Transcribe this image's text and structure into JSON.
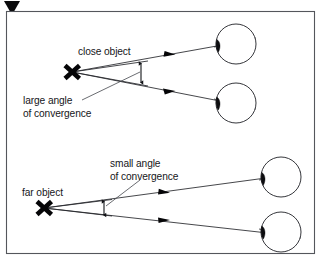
{
  "figure": {
    "corner_marker": "down-triangle-marker",
    "frame": {
      "x": 6,
      "y": 11,
      "width": 309,
      "height": 243,
      "stroke": "#54565c",
      "fill": "#ffffff"
    }
  },
  "labels": {
    "close_object": "close object",
    "large_angle_line1": "large angle",
    "large_angle_line2": "of convergence",
    "far_object": "far object",
    "small_angle_line1": "small angle",
    "small_angle_line2": "of convergence"
  },
  "colors": {
    "ink": "#16161a",
    "ray": "#25262b",
    "frame": "#54565c",
    "lens_fill": "#0d0d10",
    "marker": "#050507",
    "background": "#ffffff"
  },
  "diagram": {
    "panels": [
      {
        "name": "close-object-panel",
        "object_label": "close object",
        "angle_label": "large angle of convergence",
        "angle_size": "large",
        "object_point": {
          "x": 72,
          "y": 72
        },
        "eyes": [
          {
            "name": "upper-eye",
            "cx": 236,
            "cy": 44,
            "r": 20
          },
          {
            "name": "lower-eye",
            "cx": 236,
            "cy": 103,
            "r": 20
          }
        ],
        "rays": [
          {
            "name": "ray-to-upper-eye",
            "from": {
              "x": 72,
              "y": 72
            },
            "to": {
              "x": 252,
              "y": 40
            },
            "arrow_at": {
              "x": 170,
              "y": 55
            }
          },
          {
            "name": "ray-to-lower-eye",
            "from": {
              "x": 72,
              "y": 72
            },
            "to": {
              "x": 252,
              "y": 107
            },
            "arrow_at": {
              "x": 170,
              "y": 91
            }
          }
        ],
        "angle_arrow": {
          "x": 141,
          "y_top": 62,
          "y_bottom": 84
        }
      },
      {
        "name": "far-object-panel",
        "object_label": "far object",
        "angle_label": "small angle of convergence",
        "angle_size": "small",
        "object_point": {
          "x": 44,
          "y": 208
        },
        "eyes": [
          {
            "name": "upper-eye",
            "cx": 281,
            "cy": 177,
            "r": 20
          },
          {
            "name": "lower-eye",
            "cx": 281,
            "cy": 232,
            "r": 20
          }
        ],
        "rays": [
          {
            "name": "ray-to-upper-eye",
            "from": {
              "x": 44,
              "y": 208
            },
            "to": {
              "x": 297,
              "y": 174
            },
            "arrow_at": {
              "x": 165,
              "y": 192
            }
          },
          {
            "name": "ray-to-lower-eye",
            "from": {
              "x": 44,
              "y": 208
            },
            "to": {
              "x": 297,
              "y": 236
            },
            "arrow_at": {
              "x": 165,
              "y": 221
            }
          }
        ],
        "angle_arrow": {
          "x": 104,
          "y_top": 200,
          "y_bottom": 216
        }
      }
    ]
  },
  "icons": {
    "corner": "down-triangle-icon",
    "object_marker": "x-cross-icon",
    "ray_direction": "arrowhead-icon",
    "angle_indicator": "double-headed-arrow-icon",
    "eye": "eye-icon"
  }
}
